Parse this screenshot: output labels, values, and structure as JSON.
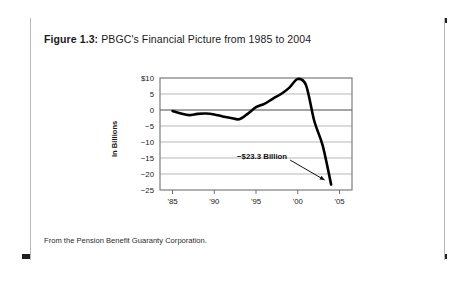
{
  "figure": {
    "label": "Figure 1.3:",
    "title": "PBGC's Financial Picture from 1985 to 2004",
    "footer": "From the Pension Benefit Guaranty Corporation."
  },
  "chart_data": {
    "type": "line",
    "title": "PBGC's Financial Picture from 1985 to 2004",
    "xlabel": "",
    "ylabel": "In Billions",
    "x": [
      1985,
      1986,
      1987,
      1988,
      1989,
      1990,
      1991,
      1992,
      1993,
      1994,
      1995,
      1996,
      1997,
      1998,
      1999,
      2000,
      2001,
      2002,
      2003,
      2004
    ],
    "values": [
      -0.3,
      -1.1,
      -1.6,
      -1.2,
      -1.1,
      -1.4,
      -2.0,
      -2.5,
      -2.9,
      -1.2,
      0.9,
      1.9,
      3.5,
      5.0,
      7.0,
      9.7,
      7.7,
      -3.6,
      -11.2,
      -23.3
    ],
    "xlim": [
      1983.5,
      2006.5
    ],
    "ylim": [
      -25,
      10
    ],
    "yticks": [
      10,
      5,
      0,
      -5,
      -10,
      -15,
      -20,
      -25
    ],
    "ytick_labels": [
      "$10",
      "5",
      "0",
      "−5",
      "−10",
      "−15",
      "−20",
      "−25"
    ],
    "xticks": [
      1985,
      1990,
      1995,
      2000,
      2005
    ],
    "xtick_labels": [
      "'85",
      "'90",
      "'95",
      "'00",
      "'05"
    ],
    "grid": "horizontal",
    "legend": "none",
    "series_color": "#000000",
    "grid_color": "#9a9a9a",
    "annotations": [
      {
        "text": "−$23.3 Billion",
        "points_to_x": 2004,
        "points_to_y": -23.3
      }
    ]
  }
}
